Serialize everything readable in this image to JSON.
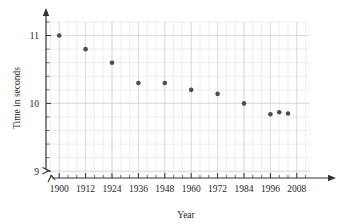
{
  "chart_data": {
    "type": "scatter",
    "title": "",
    "xlabel": "Year",
    "ylabel": "Time in seconds",
    "x": [
      1900,
      1912,
      1924,
      1936,
      1948,
      1960,
      1972,
      1984,
      1996,
      2000,
      2004
    ],
    "values": [
      11.0,
      10.8,
      10.6,
      10.3,
      10.3,
      10.2,
      10.14,
      10.0,
      9.84,
      9.87,
      9.85
    ],
    "points": [
      {
        "x": 1900,
        "y": 11.0
      },
      {
        "x": 1912,
        "y": 10.8
      },
      {
        "x": 1924,
        "y": 10.6
      },
      {
        "x": 1936,
        "y": 10.3
      },
      {
        "x": 1948,
        "y": 10.3
      },
      {
        "x": 1960,
        "y": 10.2
      },
      {
        "x": 1972,
        "y": 10.14
      },
      {
        "x": 1984,
        "y": 10.0
      },
      {
        "x": 1996,
        "y": 9.84
      },
      {
        "x": 2000,
        "y": 9.87
      },
      {
        "x": 2004,
        "y": 9.85
      }
    ],
    "xlim": [
      1894,
      2014
    ],
    "ylim": [
      8.9,
      11.2
    ],
    "xticks": [
      1900,
      1912,
      1924,
      1936,
      1948,
      1960,
      1972,
      1984,
      1996,
      2008
    ],
    "xtick_labels": [
      "1900",
      "1912",
      "1924",
      "1936",
      "1948",
      "1960",
      "1972",
      "1984",
      "1996",
      "2008"
    ],
    "yticks": [
      9,
      10,
      11
    ],
    "ytick_labels": [
      "9",
      "10",
      "11"
    ],
    "y_minor_step": 0.2,
    "x_minor_step": 4,
    "grid": true,
    "legend": "none",
    "axis_break_x": true,
    "axis_break_y": true,
    "arrow_x_end": true,
    "arrow_y_end": true,
    "marker": "filled-circle",
    "marker_color": "#4d4d4d",
    "grid_color": "#e2e2e2",
    "axis_color": "#333333"
  }
}
